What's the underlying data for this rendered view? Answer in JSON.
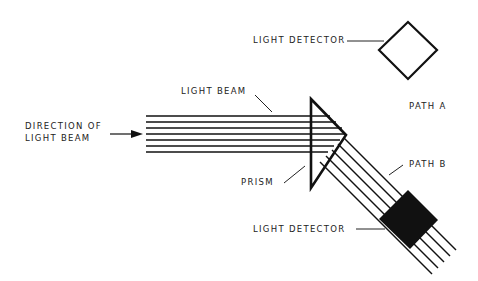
{
  "labels": {
    "light_detector_top": "LIGHT DETECTOR",
    "light_beam": "LIGHT BEAM",
    "path_a": "PATH A",
    "direction_line1": "DIRECTION OF",
    "direction_line2": "LIGHT BEAM",
    "path_b": "PATH B",
    "prism": "PRISM",
    "light_detector_bottom": "LIGHT DETECTOR"
  },
  "colors": {
    "ink": "#111111",
    "background": "#ffffff"
  }
}
